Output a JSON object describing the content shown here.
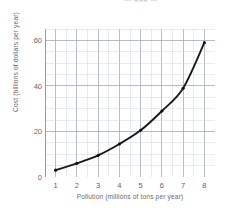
{
  "scan": {
    "header_fragment": "—  ■■■  —"
  },
  "chart_data": {
    "type": "line",
    "title": "",
    "xlabel": "Pollution (millions of tons per year)",
    "ylabel": "Cost (billions of dollars per year)",
    "xlim": [
      0.5,
      8.5
    ],
    "ylim": [
      0,
      65
    ],
    "grid": true,
    "grid_minor_x_step": 0.5,
    "grid_minor_y_step": 5,
    "legend": "none",
    "x_tick_labels": [
      "1",
      "2",
      "3",
      "4",
      "5",
      "6",
      "7",
      "8"
    ],
    "x_ticks": [
      1,
      2,
      3,
      4,
      5,
      6,
      7,
      8
    ],
    "y_tick_labels": [
      "0",
      "20",
      "40",
      "60"
    ],
    "y_ticks": [
      0,
      20,
      40,
      60
    ],
    "x": [
      1,
      2,
      3,
      4,
      5,
      6,
      7,
      8
    ],
    "values": [
      3,
      6,
      9.5,
      14.5,
      20.5,
      29,
      39,
      59
    ],
    "series": [
      {
        "name": "Cost of pollution reduction",
        "x": [
          1,
          2,
          3,
          4,
          5,
          6,
          7,
          8
        ],
        "values": [
          3,
          6,
          9.5,
          14.5,
          20.5,
          29,
          39,
          59
        ],
        "color": "#1a1a1a",
        "marker": "dot",
        "line_style": "solid"
      }
    ],
    "colors": {
      "curve": "#1a1a1a",
      "marker": "#111111",
      "grid_minor": "#cfd4dc",
      "grid_major": "#9aa2ad",
      "axis": "#8d949e",
      "text": "#6b6b6b",
      "background": "#ffffff"
    }
  }
}
